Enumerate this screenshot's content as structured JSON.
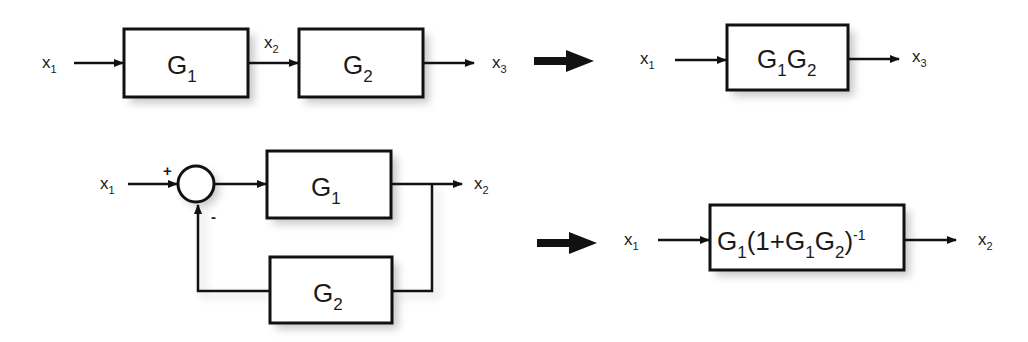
{
  "diagram": {
    "type": "block-diagram-reduction",
    "colors": {
      "line": "#111111",
      "box_fill": "#ffffff",
      "text": "#1a1a1a",
      "shadow": "#9a9a9a"
    },
    "series_rule": {
      "original": {
        "input": {
          "base": "x",
          "sub": "1"
        },
        "block1": {
          "base": "G",
          "sub": "1"
        },
        "intermediate": {
          "base": "x",
          "sub": "2"
        },
        "block2": {
          "base": "G",
          "sub": "2"
        },
        "output": {
          "base": "x",
          "sub": "3"
        }
      },
      "reduced": {
        "input": {
          "base": "x",
          "sub": "1"
        },
        "block": {
          "g1": "G",
          "s1": "1",
          "g2": "G",
          "s2": "2"
        },
        "output": {
          "base": "x",
          "sub": "3"
        }
      }
    },
    "feedback_rule": {
      "original": {
        "input": {
          "base": "x",
          "sub": "1"
        },
        "summer_plus": "+",
        "summer_minus": "-",
        "forward_block": {
          "base": "G",
          "sub": "1"
        },
        "feedback_block": {
          "base": "G",
          "sub": "2"
        },
        "output": {
          "base": "x",
          "sub": "2"
        }
      },
      "reduced": {
        "input": {
          "base": "x",
          "sub": "1"
        },
        "block": {
          "p1": "G",
          "s1": "1",
          "p2": "(1+G",
          "s2": "1",
          "p3": "G",
          "s3": "2",
          "p4": ")",
          "sup": "-1"
        },
        "output": {
          "base": "x",
          "sub": "2"
        }
      }
    }
  }
}
